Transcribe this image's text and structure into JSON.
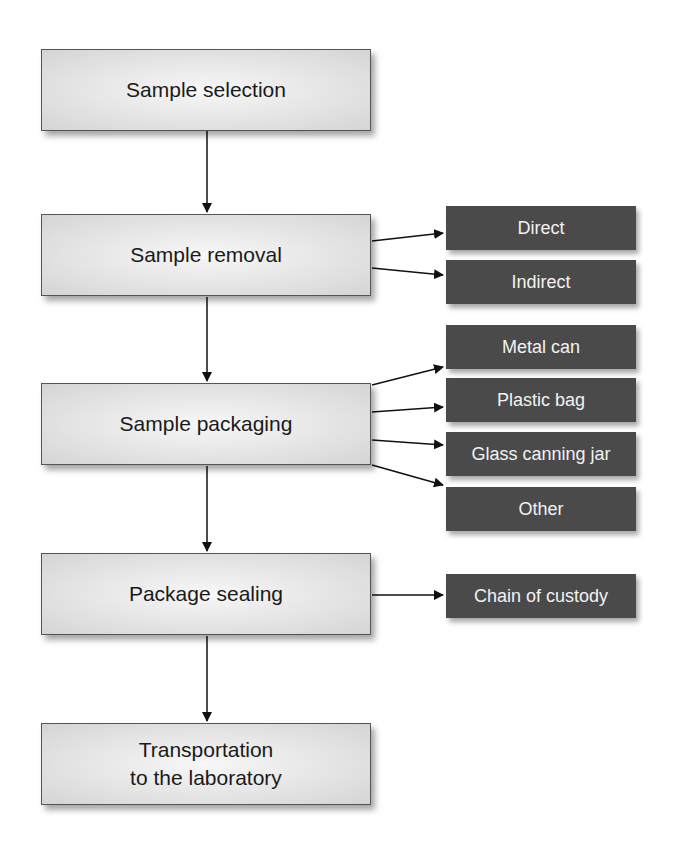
{
  "main_steps": [
    {
      "label": "Sample selection"
    },
    {
      "label": "Sample removal"
    },
    {
      "label": "Sample packaging"
    },
    {
      "label": "Package sealing"
    },
    {
      "label": "Transportation\nto the laboratory"
    }
  ],
  "removal_options": [
    {
      "label": "Direct"
    },
    {
      "label": "Indirect"
    }
  ],
  "packaging_options": [
    {
      "label": "Metal can"
    },
    {
      "label": "Plastic bag"
    },
    {
      "label": "Glass canning jar"
    },
    {
      "label": "Other"
    }
  ],
  "sealing_options": [
    {
      "label": "Chain of custody"
    }
  ],
  "colors": {
    "main_box_fill": "#e3e3e3",
    "dark_box_fill": "#4a4a4a",
    "arrow": "#111111"
  }
}
